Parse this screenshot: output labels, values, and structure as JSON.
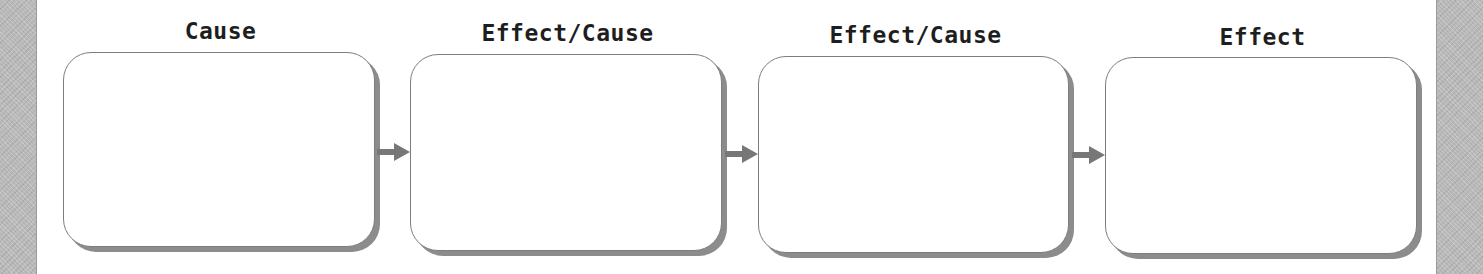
{
  "diagram": {
    "type": "cause-effect chain",
    "nodes": [
      {
        "label": "Cause",
        "content": ""
      },
      {
        "label": "Effect/Cause",
        "content": ""
      },
      {
        "label": "Effect/Cause",
        "content": ""
      },
      {
        "label": "Effect",
        "content": ""
      }
    ],
    "connectors": [
      {
        "from": 0,
        "to": 1,
        "icon": "arrow-right-icon"
      },
      {
        "from": 1,
        "to": 2,
        "icon": "arrow-right-icon"
      },
      {
        "from": 2,
        "to": 3,
        "icon": "arrow-right-icon"
      }
    ],
    "colors": {
      "border": "#7d7d7d",
      "shadow": "#8c8c8c",
      "arrow": "#777777",
      "side_strip": "#b9b9b9",
      "text": "#1e1e1e"
    }
  }
}
